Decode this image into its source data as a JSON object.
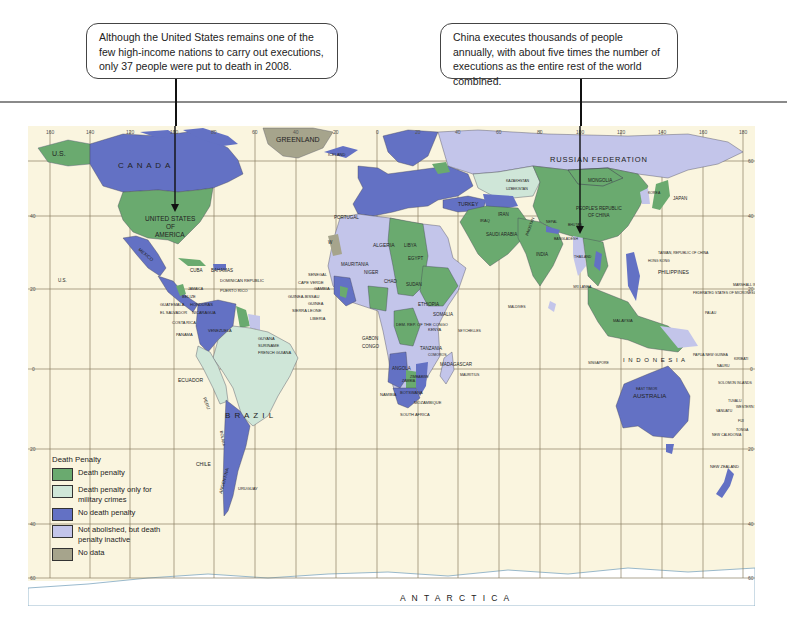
{
  "callouts": {
    "us": "Although the United States remains one of the few high-income nations to carry out executions, only 37 people were put to death in 2008.",
    "china": "China executes thousands of people annually, with about five times the number of executions as the entire rest of the world combined."
  },
  "colors": {
    "death_penalty": "#6aaa6f",
    "military_only": "#cfe6d8",
    "no_death_penalty": "#6371c4",
    "inactive": "#c3c5ea",
    "no_data": "#a6a48c",
    "ocean": "#faf5df",
    "grid": "#8a7f62"
  },
  "legend": {
    "title": "Death Penalty",
    "items": [
      {
        "label": "Death penalty",
        "color": "#6aaa6f"
      },
      {
        "label": "Death penalty only for military crimes",
        "color": "#cfe6d8"
      },
      {
        "label": "No death penalty",
        "color": "#6371c4"
      },
      {
        "label": "Not abolished, but death penalty inactive",
        "color": "#c3c5ea"
      },
      {
        "label": "No data",
        "color": "#a6a48c"
      }
    ]
  },
  "map": {
    "longitude_ticks": [
      "160",
      "140",
      "120",
      "100",
      "80",
      "60",
      "40",
      "20",
      "0",
      "20",
      "40",
      "60",
      "80",
      "100",
      "120",
      "140",
      "160",
      "180"
    ],
    "latitude_ticks": [
      "60",
      "40",
      "20",
      "0",
      "20",
      "40",
      "60"
    ],
    "labels": {
      "us_alaska": "U.S.",
      "canada": "C A N A D A",
      "greenland": "GREENLAND",
      "usa": [
        "UNITED STATES",
        "OF",
        "AMERICA"
      ],
      "mexico": "MEXICO",
      "us_hawaii": "U.S.",
      "cuba": "CUBA",
      "bahamas": "BAHAMAS",
      "dominican_republic": "DOMINICAN REPUBLIC",
      "puerto_rico": "PUERTO RICO",
      "jamaica": "JAMAICA",
      "belize": "BELIZE",
      "honduras": "HONDURAS",
      "guatemala": "GUATEMALA",
      "el_salvador": "EL SALVADOR",
      "nicaragua": "NICARAGUA",
      "costa_rica": "COSTA RICA",
      "panama": "PANAMA",
      "venezuela": "VENEZUELA",
      "colombia": "COLOMBIA",
      "guyana": "GUYANA",
      "suriname": "SURINAME",
      "french_guiana": "FRENCH GUIANA",
      "ecuador": "ECUADOR",
      "peru": "PERU",
      "brazil": "B R A Z I L",
      "bolivia": "BOLIVIA",
      "chile": "CHILE",
      "argentina": "ARGENTINA",
      "uruguay": "URUGUAY",
      "iceland": "ICELAND",
      "portugal": "PORTUGAL",
      "spain": "SPAIN",
      "morocco": "MOROCCO",
      "western_sahara": "WESTERN SAHARA",
      "algeria": "ALGERIA",
      "libya": "LIBYA",
      "egypt": "EGYPT",
      "mauritania": "MAURITANIA",
      "mali": "MALI",
      "niger": "NIGER",
      "chad": "CHAD",
      "sudan": "SUDAN",
      "senegal": "SENEGAL",
      "cape_verde": "CAPE VERDE",
      "gambia": "GAMBIA",
      "guinea_bissau": "GUINEA-BISSAU",
      "guinea": "GUINEA",
      "sierra_leone": "SIERRA LEONE",
      "liberia": "LIBERIA",
      "nigeria": "NIGERIA",
      "ethiopia": "ETHIOPIA",
      "somalia": "SOMALIA",
      "kenya": "KENYA",
      "dem_rep_congo": "DEM. REP. OF THE CONGO",
      "gabon": "GABON",
      "congo": "CONGO",
      "tanzania": "TANZANIA",
      "angola": "ANGOLA",
      "zambia": "ZAMBIA",
      "namibia": "NAMIBIA",
      "botswana": "BOTSWANA",
      "zimbabwe": "ZIMBABWE",
      "mozambique": "MOZAMBIQUE",
      "south_africa": "SOUTH AFRICA",
      "madagascar": "MADAGASCAR",
      "comoros": "COMOROS",
      "seychelles": "SEYCHELLES",
      "mauritius": "MAURITIUS",
      "maldives": "MALDIVES",
      "turkey": "TURKEY",
      "saudi_arabia": "SAUDI ARABIA",
      "iran": "IRAN",
      "iraq": "IRAQ",
      "russia": "RUSSIAN FEDERATION",
      "kazakhstan": "KAZAKHSTAN",
      "uzbekistan": "UZBEKISTAN",
      "mongolia": "MONGOLIA",
      "china": [
        "PEOPLE'S REPUBLIC",
        "OF CHINA"
      ],
      "india": "INDIA",
      "pakistan": "PAKISTAN",
      "nepal": "NEPAL",
      "bhutan": "BHUTAN",
      "bangladesh": "BANGLADESH",
      "myanmar": "MYANMAR",
      "thailand": "THAILAND",
      "sri_lanka": "SRI LANKA",
      "japan": "JAPAN",
      "korea": "KOREA",
      "taiwan": "TAIWAN, REPUBLIC OF CHINA",
      "hong_kong": "HONG KONG",
      "philippines": "PHILIPPINES",
      "malaysia": "MALAYSIA",
      "singapore": "SINGAPORE",
      "indonesia": "I N D O N E S I A",
      "east_timor": "EAST TIMOR",
      "papua_new_guinea": "PAPUA NEW GUINEA",
      "micronesia": "FEDERATED STATES OF MICRONESIA",
      "palau": "PALAU",
      "marshall_islands": "MARSHALL ISLANDS",
      "nauru": "NAURU",
      "kiribati": "KIRIBATI",
      "solomon_islands": "SOLOMON ISLANDS",
      "tuvalu": "TUVALU",
      "vanuatu": "VANUATU",
      "western_samoa": "WESTERN SAMOA",
      "fiji": "FIJI",
      "tonga": "TONGA",
      "new_caledonia": "NEW CALEDONIA",
      "australia": "AUSTRALIA",
      "new_zealand": "NEW ZEALAND",
      "antarctica": "A N T A R C T I C A"
    }
  }
}
